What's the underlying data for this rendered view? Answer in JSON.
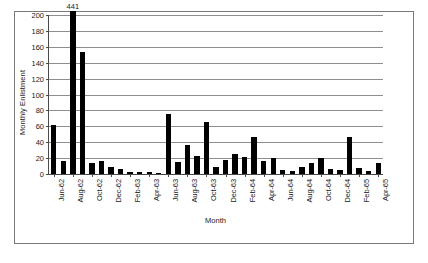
{
  "chart_data": {
    "type": "bar",
    "title": "",
    "xlabel": "Month",
    "ylabel": "Monthly Enlistment",
    "ylim": [
      0,
      200
    ],
    "ytick_step": 20,
    "yticks": [
      0,
      20,
      40,
      60,
      80,
      100,
      120,
      140,
      160,
      180,
      200
    ],
    "grid": true,
    "legend": false,
    "bar_color": "#000000",
    "categories": [
      "Jun-62",
      "Jul-62",
      "Aug-62",
      "Sep-62",
      "Oct-62",
      "Nov-62",
      "Dec-62",
      "Jan-63",
      "Feb-63",
      "Mar-63",
      "Apr-63",
      "May-63",
      "Jun-63",
      "Jul-63",
      "Aug-63",
      "Sep-63",
      "Oct-63",
      "Nov-63",
      "Dec-63",
      "Jan-64",
      "Feb-64",
      "Mar-64",
      "Apr-64",
      "May-64",
      "Jun-64",
      "Jul-64",
      "Aug-64",
      "Sep-64",
      "Oct-64",
      "Nov-64",
      "Dec-64",
      "Jan-65",
      "Feb-65",
      "Mar-65",
      "Apr-65"
    ],
    "values": [
      62,
      17,
      441,
      154,
      14,
      16,
      9,
      6,
      2,
      3,
      2,
      1,
      75,
      15,
      37,
      23,
      66,
      9,
      18,
      25,
      22,
      46,
      16,
      20,
      5,
      4,
      9,
      14,
      20,
      6,
      5,
      46,
      8,
      4,
      14
    ],
    "xtick_labels": [
      "Jun-62",
      "Aug-62",
      "Oct-62",
      "Dec-62",
      "Feb-63",
      "Apr-63",
      "Jun-63",
      "Aug-63",
      "Oct-63",
      "Dec-63",
      "Feb-64",
      "Apr-64",
      "Jun-64",
      "Aug-64",
      "Oct-64",
      "Dec-64",
      "Feb-65",
      "Apr-65"
    ],
    "xtick_indices": [
      0,
      2,
      4,
      6,
      8,
      10,
      12,
      14,
      16,
      18,
      20,
      22,
      24,
      26,
      28,
      30,
      32,
      34
    ],
    "annotations": [
      {
        "label": "441",
        "category": "Aug-62",
        "index": 2,
        "note": "bar value exceeds axis maximum and is clipped"
      }
    ]
  }
}
